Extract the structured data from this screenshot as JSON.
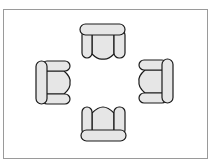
{
  "diagram": {
    "title": "",
    "colors": {
      "background": "#ffffff",
      "frame": "#9a9a9a",
      "outline": "#1a1a1a",
      "fill": "#e6e6e6"
    },
    "chairs": [
      {
        "id": "top",
        "facing": "down"
      },
      {
        "id": "left",
        "facing": "right"
      },
      {
        "id": "right",
        "facing": "left"
      },
      {
        "id": "bottom",
        "facing": "up"
      }
    ]
  }
}
